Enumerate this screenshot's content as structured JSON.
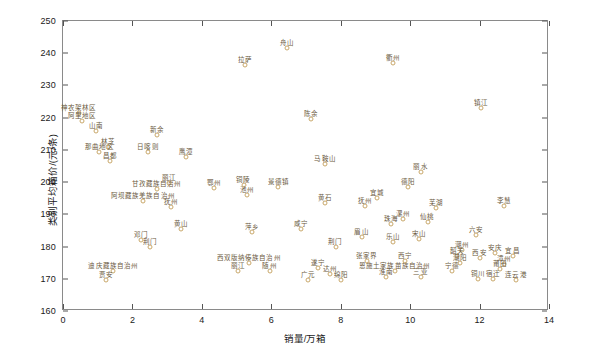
{
  "chart_data": {
    "type": "scatter",
    "title": "",
    "xlabel": "销量/万箱",
    "ylabel": "类别平均箱价/(元/条)",
    "xlim": [
      0,
      14
    ],
    "ylim": [
      160,
      250
    ],
    "xticks": [
      0,
      2,
      4,
      6,
      8,
      10,
      12,
      14
    ],
    "yticks": [
      160,
      170,
      180,
      190,
      200,
      210,
      220,
      230,
      240,
      250
    ],
    "grid": false,
    "legend": "none",
    "marker_color": "#c9a86a",
    "label_color": "#6b5a3e",
    "points": [
      {
        "label": "神农架林区",
        "x": 0.45,
        "y": 221.5
      },
      {
        "label": "阿里地区",
        "x": 0.55,
        "y": 219.0
      },
      {
        "label": "山南",
        "x": 0.95,
        "y": 216.0
      },
      {
        "label": "林芝",
        "x": 1.3,
        "y": 210.8
      },
      {
        "label": "那曲地区",
        "x": 1.05,
        "y": 209.2
      },
      {
        "label": "昌都",
        "x": 1.35,
        "y": 206.5
      },
      {
        "label": "日喀则",
        "x": 2.45,
        "y": 209.3
      },
      {
        "label": "鹰潭",
        "x": 3.55,
        "y": 207.8
      },
      {
        "label": "新余",
        "x": 2.7,
        "y": 214.5
      },
      {
        "label": "拉萨",
        "x": 5.25,
        "y": 236.5
      },
      {
        "label": "舟山",
        "x": 6.45,
        "y": 241.5
      },
      {
        "label": "衢州",
        "x": 9.5,
        "y": 237.0
      },
      {
        "label": "镇江",
        "x": 12.05,
        "y": 223.0
      },
      {
        "label": "陈余",
        "x": 7.15,
        "y": 219.5
      },
      {
        "label": "马鞍山",
        "x": 7.55,
        "y": 205.5
      },
      {
        "label": "丽水",
        "x": 10.3,
        "y": 203.0
      },
      {
        "label": "丽江",
        "x": 3.05,
        "y": 199.8
      },
      {
        "label": "甘孜藏族自治州",
        "x": 2.7,
        "y": 198.0
      },
      {
        "label": "阿坝藏族羌族自治州",
        "x": 2.3,
        "y": 194.0
      },
      {
        "label": "鄂州",
        "x": 4.35,
        "y": 198.2
      },
      {
        "label": "铜陵",
        "x": 5.2,
        "y": 199.0
      },
      {
        "label": "池州",
        "x": 5.3,
        "y": 196.0
      },
      {
        "label": "景德镇",
        "x": 6.2,
        "y": 198.5
      },
      {
        "label": "抚州",
        "x": 3.1,
        "y": 192.2
      },
      {
        "label": "黄山",
        "x": 3.4,
        "y": 185.5
      },
      {
        "label": "荆门",
        "x": 2.5,
        "y": 180.0
      },
      {
        "label": "萍乡",
        "x": 5.45,
        "y": 184.5
      },
      {
        "label": "黄石",
        "x": 7.55,
        "y": 193.5
      },
      {
        "label": "宜城",
        "x": 9.05,
        "y": 195.0
      },
      {
        "label": "德阳",
        "x": 9.95,
        "y": 198.5
      },
      {
        "label": "抚州",
        "x": 8.7,
        "y": 192.5
      },
      {
        "label": "芜湖",
        "x": 10.75,
        "y": 192.0
      },
      {
        "label": "漯州",
        "x": 9.8,
        "y": 188.5
      },
      {
        "label": "珠海",
        "x": 9.45,
        "y": 187.0
      },
      {
        "label": "仙桃",
        "x": 10.5,
        "y": 187.5
      },
      {
        "label": "咸宁",
        "x": 6.85,
        "y": 185.5
      },
      {
        "label": "眉山",
        "x": 8.6,
        "y": 183.0
      },
      {
        "label": "乐山",
        "x": 9.5,
        "y": 181.5
      },
      {
        "label": "宋山",
        "x": 10.25,
        "y": 182.5
      },
      {
        "label": "荆门",
        "x": 7.85,
        "y": 180.0
      },
      {
        "label": "李慧",
        "x": 12.7,
        "y": 192.5
      },
      {
        "label": "六安",
        "x": 11.9,
        "y": 183.5
      },
      {
        "label": "潮州",
        "x": 11.5,
        "y": 179.0
      },
      {
        "label": "韶关",
        "x": 11.35,
        "y": 177.0
      },
      {
        "label": "西安",
        "x": 12.0,
        "y": 176.5
      },
      {
        "label": "安庆",
        "x": 12.45,
        "y": 178.0
      },
      {
        "label": "宜昌",
        "x": 12.95,
        "y": 177.0
      },
      {
        "label": "漳州",
        "x": 12.7,
        "y": 174.5
      },
      {
        "label": "莆田",
        "x": 12.6,
        "y": 173.0
      },
      {
        "label": "宁德",
        "x": 11.2,
        "y": 172.5
      },
      {
        "label": "潮阳",
        "x": 11.45,
        "y": 175.0
      },
      {
        "label": "铜川",
        "x": 11.95,
        "y": 170.0
      },
      {
        "label": "宿迁",
        "x": 12.4,
        "y": 170.0
      },
      {
        "label": "连云港",
        "x": 13.05,
        "y": 169.5
      },
      {
        "label": "恩施土家族苗族自治州",
        "x": 9.55,
        "y": 172.5
      },
      {
        "label": "西宁",
        "x": 9.85,
        "y": 175.5
      },
      {
        "label": "淮南",
        "x": 9.3,
        "y": 170.5
      },
      {
        "label": "三亚",
        "x": 10.3,
        "y": 170.5
      },
      {
        "label": "张家界",
        "x": 8.75,
        "y": 175.5
      },
      {
        "label": "遂宁",
        "x": 7.35,
        "y": 173.5
      },
      {
        "label": "广元",
        "x": 7.05,
        "y": 169.5
      },
      {
        "label": "达州",
        "x": 7.7,
        "y": 171.5
      },
      {
        "label": "绵阳",
        "x": 8.0,
        "y": 169.5
      },
      {
        "label": "西双版纳傣族自治州",
        "x": 5.35,
        "y": 175.0
      },
      {
        "label": "丽江",
        "x": 5.05,
        "y": 172.5
      },
      {
        "label": "随州",
        "x": 5.95,
        "y": 172.5
      },
      {
        "label": "迪庆藏族自治州",
        "x": 1.45,
        "y": 172.5
      },
      {
        "label": "贾安",
        "x": 1.25,
        "y": 169.5
      },
      {
        "label": "邓门",
        "x": 2.25,
        "y": 182.0
      }
    ]
  }
}
